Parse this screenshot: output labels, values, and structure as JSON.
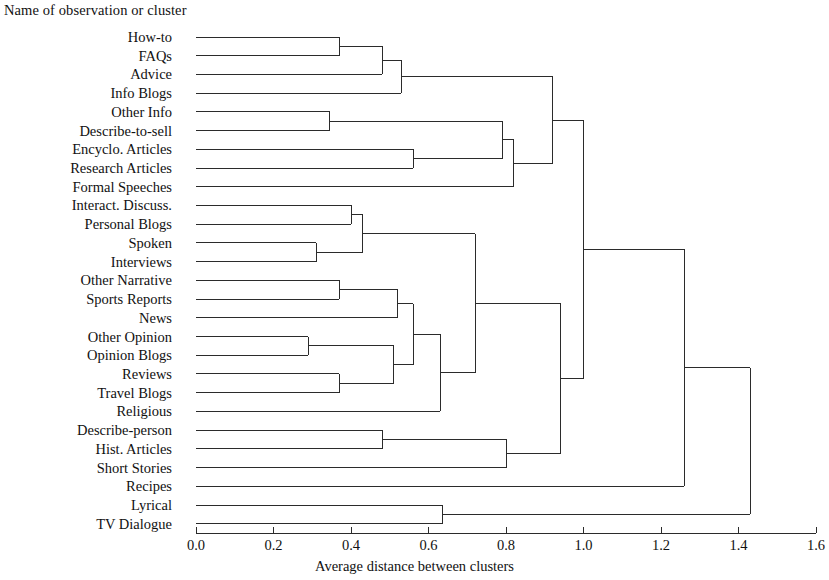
{
  "figure": {
    "leaf_axis_title": "Name of observation or cluster",
    "value_axis_title": "Average distance between clusters",
    "line_color": "#2b2b2b",
    "text_color": "#111111",
    "background": "#ffffff"
  },
  "chart_data": {
    "type": "dendrogram",
    "title": "",
    "xlabel": "Average distance between clusters",
    "ylabel": "Name of observation or cluster",
    "orientation": "horizontal",
    "xlim": [
      0.0,
      1.6
    ],
    "grid": false,
    "legend": null,
    "tick_labels": [
      "0.0",
      "0.2",
      "0.4",
      "0.6",
      "0.8",
      "1.0",
      "1.2",
      "1.4",
      "1.6"
    ],
    "tick_values": [
      0.0,
      0.2,
      0.4,
      0.6,
      0.8,
      1.0,
      1.2,
      1.4,
      1.6
    ],
    "leaves": [
      "How-to",
      "FAQs",
      "Advice",
      "Info Blogs",
      "Other Info",
      "Describe-to-sell",
      "Encyclo. Articles",
      "Research Articles",
      "Formal Speeches",
      "Interact. Discuss.",
      "Personal Blogs",
      "Spoken",
      "Interviews",
      "Other Narrative",
      "Sports Reports",
      "News",
      "Other Opinion",
      "Opinion Blogs",
      "Reviews",
      "Travel Blogs",
      "Religious",
      "Describe-person",
      "Hist. Articles",
      "Short Stories",
      "Recipes",
      "Lyrical",
      "TV Dialogue"
    ],
    "merges": [
      {
        "id": "m1",
        "left": "How-to",
        "right": "FAQs",
        "distance": 0.37
      },
      {
        "id": "m2",
        "left": "m1",
        "right": "Advice",
        "distance": 0.48
      },
      {
        "id": "m3",
        "left": "m2",
        "right": "Info Blogs",
        "distance": 0.53
      },
      {
        "id": "m4",
        "left": "Other Info",
        "right": "Describe-to-sell",
        "distance": 0.345
      },
      {
        "id": "m5",
        "left": "Encyclo. Articles",
        "right": "Research Articles",
        "distance": 0.56
      },
      {
        "id": "m6",
        "left": "m4",
        "right": "m5",
        "distance": 0.79
      },
      {
        "id": "m7",
        "left": "m6",
        "right": "Formal Speeches",
        "distance": 0.82
      },
      {
        "id": "m8",
        "left": "m3",
        "right": "m7",
        "distance": 0.92
      },
      {
        "id": "m9",
        "left": "Interact. Discuss.",
        "right": "Personal Blogs",
        "distance": 0.4
      },
      {
        "id": "m10",
        "left": "Spoken",
        "right": "Interviews",
        "distance": 0.31
      },
      {
        "id": "m11",
        "left": "m9",
        "right": "m10",
        "distance": 0.43
      },
      {
        "id": "m12",
        "left": "Other Narrative",
        "right": "Sports Reports",
        "distance": 0.37
      },
      {
        "id": "m13",
        "left": "m12",
        "right": "News",
        "distance": 0.52
      },
      {
        "id": "m14",
        "left": "Other Opinion",
        "right": "Opinion Blogs",
        "distance": 0.29
      },
      {
        "id": "m15",
        "left": "Reviews",
        "right": "Travel Blogs",
        "distance": 0.37
      },
      {
        "id": "m16",
        "left": "m14",
        "right": "m15",
        "distance": 0.51
      },
      {
        "id": "m17",
        "left": "m13",
        "right": "m16",
        "distance": 0.56
      },
      {
        "id": "m18",
        "left": "m17",
        "right": "Religious",
        "distance": 0.63
      },
      {
        "id": "m19",
        "left": "m11",
        "right": "m18",
        "distance": 0.72
      },
      {
        "id": "m20",
        "left": "Describe-person",
        "right": "Hist. Articles",
        "distance": 0.48
      },
      {
        "id": "m21",
        "left": "m20",
        "right": "Short Stories",
        "distance": 0.8
      },
      {
        "id": "m22",
        "left": "m19",
        "right": "m21",
        "distance": 0.94
      },
      {
        "id": "m23",
        "left": "m8",
        "right": "m22",
        "distance": 1.0
      },
      {
        "id": "m24",
        "left": "m23",
        "right": "Recipes",
        "distance": 1.26
      },
      {
        "id": "m25",
        "left": "Lyrical",
        "right": "TV Dialogue",
        "distance": 0.635
      },
      {
        "id": "m26",
        "left": "m24",
        "right": "m25",
        "distance": 1.43
      }
    ]
  },
  "geometry": {
    "x_zero_px": 196,
    "x_px_per_unit": 387.5,
    "first_row_y_px": 37,
    "row_step_px": 18.72,
    "axis_y_px": 533,
    "tick_len_px": 6
  }
}
